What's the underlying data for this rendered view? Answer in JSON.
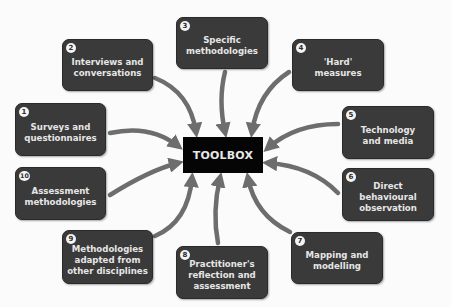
{
  "diagram": {
    "center": {
      "label": "TOOLBOX"
    },
    "nodes": [
      {
        "number": "1",
        "label": "Surveys and\nquestionnaires"
      },
      {
        "number": "2",
        "label": "Interviews and\nconversations"
      },
      {
        "number": "3",
        "label": "Specific\nmethodologies"
      },
      {
        "number": "4",
        "label": "'Hard'\nmeasures"
      },
      {
        "number": "5",
        "label": "Technology\nand media"
      },
      {
        "number": "6",
        "label": "Direct\nbehavioural\nobservation"
      },
      {
        "number": "7",
        "label": "Mapping and\nmodelling"
      },
      {
        "number": "8",
        "label": "Practitioner's\nreflection and\nassessment"
      },
      {
        "number": "9",
        "label": "Methodologies\nadapted from\nother disciplines"
      },
      {
        "number": "10",
        "label": "Assessment\nmethodologies"
      }
    ],
    "colors": {
      "node_fill": "#3a3a3a",
      "center_fill": "#050505",
      "arrow": "#6d6d6d",
      "background": "#fbfbfb"
    }
  }
}
